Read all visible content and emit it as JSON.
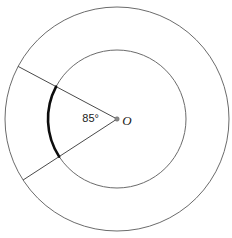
{
  "figure": {
    "type": "geometry-diagram",
    "width": 232,
    "height": 238,
    "background_color": "#ffffff",
    "center": {
      "label": "O",
      "x": 117,
      "y": 119,
      "dot_radius": 2.2,
      "dot_color": "#8a8a8a",
      "label_offset_x": 10,
      "label_offset_y": 6
    },
    "circles": [
      {
        "name": "outer-circle",
        "radius": 112,
        "stroke": "#6b6b6b",
        "stroke_width": 1,
        "fill": "none"
      },
      {
        "name": "inner-circle",
        "radius": 69,
        "stroke": "#6b6b6b",
        "stroke_width": 1,
        "fill": "none"
      }
    ],
    "radii": [
      {
        "name": "upper-radius",
        "angle_deg": 152,
        "end_x": 18,
        "end_y": 66,
        "stroke": "#4a4a4a",
        "stroke_width": 1
      },
      {
        "name": "lower-radius",
        "angle_deg": 213,
        "end_x": 23,
        "end_y": 180,
        "stroke": "#4a4a4a",
        "stroke_width": 1
      }
    ],
    "highlighted_arc": {
      "name": "highlighted-arc",
      "on_circle": "inner-circle",
      "radius": 69,
      "start_angle_deg": 152,
      "end_angle_deg": 213,
      "stroke": "#0d0d0d",
      "stroke_width": 2.6,
      "fill": "none"
    },
    "angle": {
      "value_text": "85°",
      "value_number": 85,
      "unit": "degrees",
      "vertex": "O",
      "label_x": 99,
      "label_y": 122
    }
  }
}
